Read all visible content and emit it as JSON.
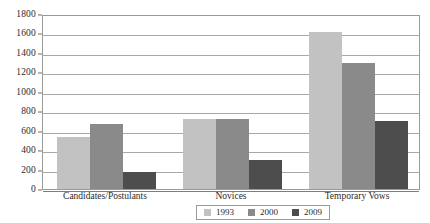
{
  "chart_data": {
    "type": "bar",
    "title": "",
    "xlabel": "",
    "ylabel": "",
    "ylim": [
      0,
      1800
    ],
    "ytick_step": 200,
    "yticks": [
      1800,
      1600,
      1400,
      1200,
      1000,
      800,
      600,
      400,
      200,
      0
    ],
    "grid": true,
    "grid_axis": "y",
    "legend_position": "bottom",
    "categories": [
      "Candidates/Postulants",
      "Novices",
      "Temporary Vows"
    ],
    "series": [
      {
        "name": "1993",
        "color": "#c2c2c2",
        "values": [
          530,
          720,
          1610
        ]
      },
      {
        "name": "2000",
        "color": "#8a8a8a",
        "values": [
          665,
          720,
          1300
        ]
      },
      {
        "name": "2009",
        "color": "#4d4d4d",
        "values": [
          175,
          300,
          700
        ]
      }
    ]
  },
  "colors": {
    "series_1993": "#c2c2c2",
    "series_2000": "#8a8a8a",
    "series_2009": "#4d4d4d",
    "gridline": "#a8a8a8",
    "axis": "#9a9a9a",
    "text": "#2b2b2b",
    "background": "#ffffff"
  }
}
